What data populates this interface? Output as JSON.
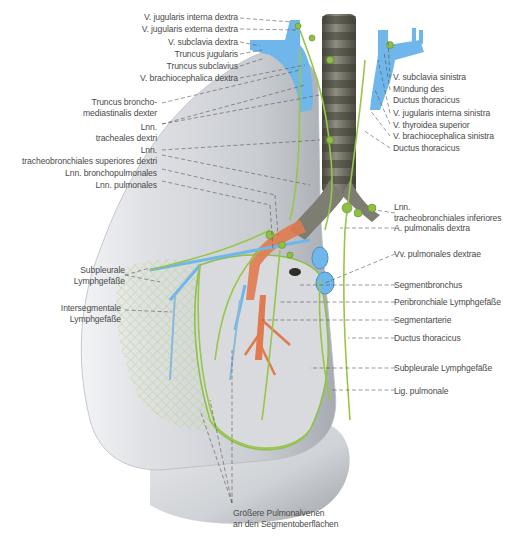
{
  "figure": {
    "colors": {
      "lung": "#d9dbdf",
      "lung_shadow": "#a9adb3",
      "vein": "#6fb6ea",
      "artery": "#e07a4f",
      "lymph": "#98c64a",
      "lymph_dark": "#5f8f2a",
      "trachea": "#6f6f63",
      "leader_line": "#444444",
      "label_text": "#4a4a4a"
    }
  },
  "labels_left": [
    {
      "id": "v-jugularis-interna-dextra",
      "lines": [
        "V. jugularis interna dextra"
      ]
    },
    {
      "id": "v-jugularis-externa-dextra",
      "lines": [
        "V. jugularis externa dextra"
      ]
    },
    {
      "id": "v-subclavia-dextra",
      "lines": [
        "V. subclavia dextra"
      ]
    },
    {
      "id": "truncus-jugularis",
      "lines": [
        "Truncus jugularis"
      ]
    },
    {
      "id": "truncus-subclavius",
      "lines": [
        "Truncus subclavius"
      ]
    },
    {
      "id": "v-brachiocephalica-dextra",
      "lines": [
        "V. brachiocephalica dextra"
      ]
    },
    {
      "id": "truncus-bronchomediastinalis-dexter",
      "lines": [
        "Truncus broncho-",
        "mediastinalis dexter"
      ]
    },
    {
      "id": "lnn-tracheales-dextri",
      "lines": [
        "Lnn.",
        "tracheales dextri"
      ]
    },
    {
      "id": "lnn-tracheobronchiales-superiores-dextri",
      "lines": [
        "Lnn.",
        "tracheobronchiales superiores dextri"
      ]
    },
    {
      "id": "lnn-bronchopulmonales",
      "lines": [
        "Lnn. bronchopulmonales"
      ]
    },
    {
      "id": "lnn-pulmonales",
      "lines": [
        "Lnn. pulmonales"
      ]
    },
    {
      "id": "subpleurale-lymphgefaesse-left",
      "lines": [
        "Subpleurale",
        "Lymphgefäße"
      ]
    },
    {
      "id": "intersegmentale-lymphgefaesse",
      "lines": [
        "Intersegmentale",
        "Lymphgefäße"
      ]
    }
  ],
  "labels_right": [
    {
      "id": "v-subclavia-sinistra",
      "lines": [
        "V. subclavia sinistra"
      ]
    },
    {
      "id": "muendung-des-ductus-thoracicus",
      "lines": [
        "Mündung des",
        "Ductus thoracicus"
      ]
    },
    {
      "id": "v-jugularis-interna-sinistra",
      "lines": [
        "V. jugularis interna sinistra"
      ]
    },
    {
      "id": "v-thyroidea-superior",
      "lines": [
        "V. thyroidea superior"
      ]
    },
    {
      "id": "v-brachiocephalica-sinistra",
      "lines": [
        "V. brachiocephalica sinistra"
      ]
    },
    {
      "id": "ductus-thoracicus-top",
      "lines": [
        "Ductus thoracicus"
      ]
    },
    {
      "id": "lnn-tracheobronchiales-inferiores",
      "lines": [
        "Lnn.",
        "tracheobronchiales inferiores"
      ]
    },
    {
      "id": "a-pulmonalis-dextra",
      "lines": [
        "A. pulmonalis dextra"
      ]
    },
    {
      "id": "vv-pulmonales-dextrae",
      "lines": [
        "Vv. pulmonales dextrae"
      ]
    },
    {
      "id": "segmentbronchus",
      "lines": [
        "Segmentbronchus"
      ]
    },
    {
      "id": "peribronchiale-lymphgefaesse",
      "lines": [
        "Peribronchiale Lymphgefäße"
      ]
    },
    {
      "id": "segmentarterie",
      "lines": [
        "Segmentarterie"
      ]
    },
    {
      "id": "ductus-thoracicus-bottom",
      "lines": [
        "Ductus thoracicus"
      ]
    },
    {
      "id": "subpleurale-lymphgefaesse-right",
      "lines": [
        "Subpleurale Lymphgefäße"
      ]
    },
    {
      "id": "lig-pulmonale",
      "lines": [
        "Lig. pulmonale"
      ]
    }
  ],
  "labels_bottom": [
    {
      "id": "groessere-pulmonalvenen",
      "lines": [
        "Größere Pulmonalvenen",
        "an den Segmentoberflächen"
      ]
    }
  ]
}
